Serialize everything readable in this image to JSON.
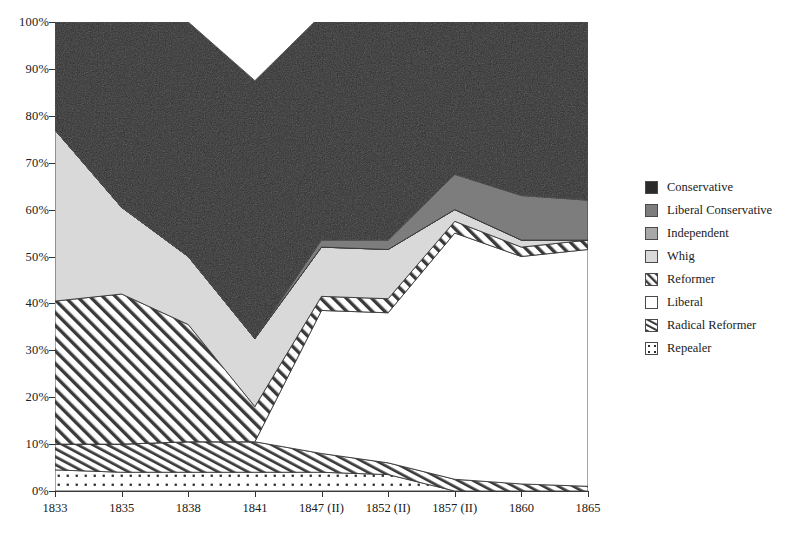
{
  "chart_data": {
    "type": "area",
    "stacked": true,
    "stack_mode": "percent",
    "title": "",
    "xlabel": "",
    "ylabel": "",
    "grid": false,
    "legend_position": "right",
    "ylim": [
      0,
      100
    ],
    "ytick_labels": [
      "0%",
      "10%",
      "20%",
      "30%",
      "40%",
      "50%",
      "60%",
      "70%",
      "80%",
      "90%",
      "100%"
    ],
    "ytick_values": [
      0,
      10,
      20,
      30,
      40,
      50,
      60,
      70,
      80,
      90,
      100
    ],
    "categories": [
      "1833",
      "1835",
      "1838",
      "1841",
      "1847 (II)",
      "1852 (II)",
      "1857 (II)",
      "1860",
      "1865"
    ],
    "series": [
      {
        "name": "Repealer",
        "fill": "dotted",
        "color": "#ffffff",
        "values": [
          4.5,
          4.0,
          4.0,
          4.0,
          4.0,
          3.5,
          0.0,
          0.0,
          0.0
        ]
      },
      {
        "name": "Radical Reformer",
        "fill": "hatch-steep",
        "color": "#ffffff",
        "values": [
          5.5,
          6.0,
          6.5,
          6.5,
          4.0,
          2.5,
          2.5,
          1.5,
          1.0
        ]
      },
      {
        "name": "Liberal",
        "fill": "solid",
        "color": "#ffffff",
        "values": [
          0.0,
          0.0,
          0.0,
          0.0,
          30.5,
          32.0,
          52.5,
          48.5,
          50.5
        ]
      },
      {
        "name": "Reformer",
        "fill": "hatch-diagonal",
        "color": "#ffffff",
        "values": [
          30.5,
          32.0,
          25.0,
          7.5,
          3.0,
          3.0,
          2.5,
          2.0,
          2.0
        ]
      },
      {
        "name": "Whig",
        "fill": "solid",
        "color": "#d9d9d9",
        "values": [
          36.5,
          18.5,
          14.5,
          14.5,
          10.5,
          10.5,
          2.5,
          1.5,
          0.0
        ]
      },
      {
        "name": "Independent",
        "fill": "solid",
        "color": "#a8a8a8",
        "values": [
          0.0,
          0.0,
          0.0,
          0.0,
          0.0,
          0.0,
          0.0,
          0.0,
          0.0
        ]
      },
      {
        "name": "Liberal Conservative",
        "fill": "solid",
        "color": "#7d7d7d",
        "values": [
          0.0,
          0.0,
          0.0,
          0.0,
          1.5,
          2.0,
          7.5,
          9.5,
          8.5
        ]
      },
      {
        "name": "Conservative",
        "fill": "solid",
        "color": "#2b2b2b",
        "values": [
          23.0,
          39.5,
          50.0,
          55.0,
          48.0,
          48.5,
          34.5,
          37.0,
          38.0
        ]
      }
    ],
    "stack_order_bottom_to_top": [
      "Repealer",
      "Radical Reformer",
      "Liberal",
      "Reformer",
      "Whig",
      "Independent",
      "Liberal Conservative",
      "Conservative"
    ]
  },
  "legend": {
    "items": [
      {
        "label": "Conservative",
        "swatch": "solid-dark",
        "color": "#2b2b2b"
      },
      {
        "label": "Liberal Conservative",
        "swatch": "solid-mid-dark",
        "color": "#7d7d7d"
      },
      {
        "label": "Independent",
        "swatch": "solid-mid",
        "color": "#a8a8a8"
      },
      {
        "label": "Whig",
        "swatch": "solid-light",
        "color": "#d9d9d9"
      },
      {
        "label": "Reformer",
        "swatch": "hatch-diagonal",
        "color": "#ffffff"
      },
      {
        "label": "Liberal",
        "swatch": "solid-white",
        "color": "#ffffff"
      },
      {
        "label": "Radical Reformer",
        "swatch": "hatch-steep",
        "color": "#ffffff"
      },
      {
        "label": "Repealer",
        "swatch": "dotted",
        "color": "#ffffff"
      }
    ]
  }
}
